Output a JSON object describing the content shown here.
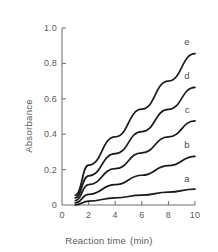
{
  "chart_data": {
    "type": "line",
    "title": "",
    "subtitle": "",
    "xlabel": "Reaction time",
    "xunit": "(min)",
    "ylabel": "Absorbance",
    "xlim": [
      0,
      10
    ],
    "ylim": [
      0,
      1.0
    ],
    "xticks": [
      0,
      2,
      4,
      6,
      8,
      10
    ],
    "xtick_labels": [
      "0",
      "2",
      "4",
      "6",
      "8",
      "10"
    ],
    "yticks": [
      0,
      0.2,
      0.4,
      0.6,
      0.8,
      1.0
    ],
    "ytick_labels": [
      "0",
      "0.2",
      "0.4",
      "0.6",
      "0.8",
      "1.0"
    ],
    "grid": false,
    "legend_position": "right-inline-labels",
    "line_color": "#1a1a1a",
    "axis_color": "#6b6b6b",
    "x": [
      1,
      2,
      4,
      6,
      8,
      10
    ],
    "series": [
      {
        "name": "a",
        "label": "a",
        "values": [
          0.0,
          0.022,
          0.04,
          0.056,
          0.073,
          0.09
        ],
        "label_x": 10,
        "label_y": 0.155
      },
      {
        "name": "b",
        "label": "b",
        "values": [
          0.012,
          0.06,
          0.115,
          0.168,
          0.222,
          0.275
        ],
        "label_x": 10,
        "label_y": 0.345
      },
      {
        "name": "c",
        "label": "c",
        "values": [
          0.025,
          0.115,
          0.205,
          0.295,
          0.385,
          0.475
        ],
        "label_x": 10,
        "label_y": 0.545
      },
      {
        "name": "d",
        "label": "d",
        "values": [
          0.04,
          0.165,
          0.29,
          0.415,
          0.54,
          0.665
        ],
        "label_x": 10,
        "label_y": 0.735
      },
      {
        "name": "e",
        "label": "e",
        "values": [
          0.055,
          0.225,
          0.385,
          0.542,
          0.7,
          0.855
        ],
        "label_x": 10,
        "label_y": 0.925
      }
    ]
  }
}
